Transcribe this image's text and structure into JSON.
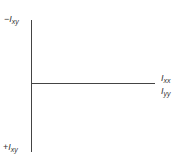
{
  "diagram": {
    "type": "mohr-circle-axes",
    "axes": {
      "vertical": {
        "top_label": {
          "sign": "−",
          "symbol": "I",
          "subscript": "xy"
        },
        "bottom_label": {
          "sign": "+",
          "symbol": "I",
          "subscript": "xy"
        }
      },
      "horizontal": {
        "labels": [
          {
            "symbol": "I",
            "subscript": "xx"
          },
          {
            "symbol": "I",
            "subscript": "yy"
          }
        ]
      }
    },
    "colors": {
      "axis": "#444444",
      "text": "#333333",
      "background": "#ffffff"
    }
  }
}
